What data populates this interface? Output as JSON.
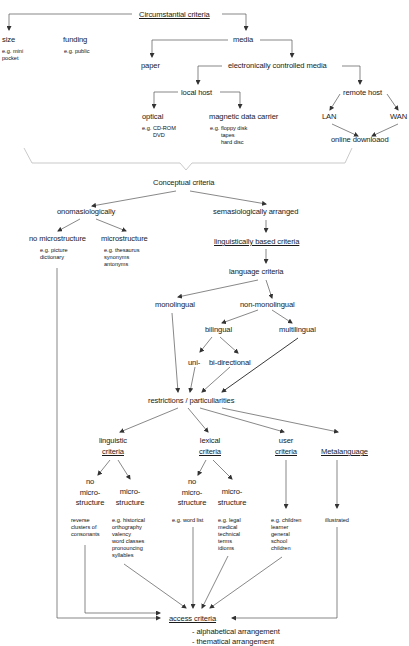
{
  "diagram": {
    "type": "hierarchical classification tree of dictionary criteria",
    "nodes": {
      "circumstantial": "Circumstantial criteria",
      "size": "size",
      "size_examples": "e.g. mini\npocket",
      "funding": "funding",
      "funding_examples": "e.g. public",
      "media": "media",
      "paper": "paper",
      "electronic": "electronically controlled media",
      "local_host": "local host",
      "remote_host": "remote host",
      "optical": "optical",
      "optical_examples": "e.g. CD-ROM\n       DVD",
      "magnetic": "magnetic data carrier",
      "magnetic_examples": "e.g. floppy disk\n       tapes\n       hard disc",
      "lan": "LAN",
      "wan": "WAN",
      "online": "online downloaod",
      "conceptual": "Conceptual criteria",
      "onomasiological": "onomasiologically",
      "semasiological": "semasiologically arranged",
      "no_micro_top": "no microstructure",
      "no_micro_top_examples": "e.g. picture\ndictionary",
      "micro_top": "microstructure",
      "micro_top_examples": "e.g. thesaurus\nsynonyms\nantonyms",
      "linguistically_based": "linguistically based criteria",
      "language_criteria": "language criteria",
      "monolingual": "monolingual",
      "non_monolingual": "non-monolingual",
      "bilingual": "bilingual",
      "multilingual": "multilingual",
      "uni": "uni-",
      "bi_directional": "bi-directional",
      "restrictions": "restrictions / particuliarities",
      "linguistic_1": "linguistic",
      "linguistic_2": "criteria",
      "lexical_1": "lexical",
      "lexical_2": "criteria",
      "user_1": "user",
      "user_2": "criteria",
      "metalanguage": "Metalanguage",
      "ling_no_micro": "no\nmicro-\nstructure",
      "ling_micro": "micro-\nstructure",
      "lex_no_micro": "no\nmicro-\nstructure",
      "lex_micro": "micro-\nstructure",
      "ling_no_micro_examples": "reverse\nclusters of\nconsonants",
      "ling_micro_examples": "e.g. historical\northography\nvalency\nword classes\npronouncing\nsyllables",
      "lex_no_micro_examples": "e.g. word list",
      "lex_micro_examples": "e.g. legal\nmedical\ntechnical\nterms\nidioms",
      "user_examples": "e.g. children\nlearner\ngeneral\nschool\nchildren",
      "meta_examples": "illustrated",
      "access": "access criteria",
      "access_list_1": "- alphabetical arrangement",
      "access_list_2": "- thematical arrangement"
    }
  }
}
